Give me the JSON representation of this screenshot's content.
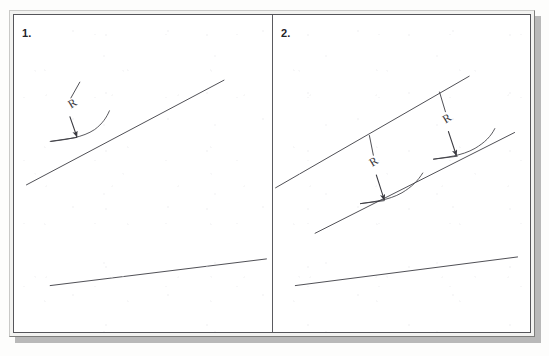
{
  "page": {
    "kind": "scanned-technical-drawing-exercise",
    "ghost_text_top": "",
    "ghost_text_bottom": "",
    "ink_color": "#3a3a40",
    "frame_color": "#55555a",
    "paper_color": "#ffffff",
    "shadow_color": "#b9b9b9"
  },
  "panels": [
    {
      "number": "1.",
      "name": "panel-one",
      "drawing": {
        "lines": [
          {
            "name": "upper-inclined-line",
            "x1": 11,
            "y1": 172,
            "x2": 211,
            "y2": 66
          },
          {
            "name": "lower-inclined-line",
            "x1": 35,
            "y1": 274,
            "x2": 254,
            "y2": 247
          }
        ],
        "radius_marks": [
          {
            "name": "radius-callout-1",
            "label": "R",
            "label_x": 56,
            "label_y": 95,
            "leader_x1": 65,
            "leader_y1": 68,
            "leader_x2": 56,
            "leader_y2": 84,
            "arrow_x1": 55,
            "arrow_y1": 103,
            "arrow_x2": 62,
            "arrow_y2": 123,
            "arc_d": "M 36 128 C 52 126, 68 124, 80 116 C 88 110, 92 104, 95 97",
            "base_d": "M 35 128 L 62 124"
          }
        ]
      }
    },
    {
      "number": "2.",
      "name": "panel-two",
      "drawing": {
        "lines": [
          {
            "name": "upper-inclined-line",
            "x1": 2,
            "y1": 175,
            "x2": 198,
            "y2": 62
          },
          {
            "name": "middle-inclined-line",
            "x1": 42,
            "y1": 221,
            "x2": 244,
            "y2": 119
          },
          {
            "name": "lower-inclined-line",
            "x1": 22,
            "y1": 274,
            "x2": 247,
            "y2": 245
          }
        ],
        "radius_marks": [
          {
            "name": "radius-callout-1",
            "label": "R",
            "label_x": 100,
            "label_y": 154,
            "leader_x1": 97,
            "leader_y1": 122,
            "leader_x2": 101,
            "leader_y2": 142,
            "arrow_x1": 104,
            "arrow_y1": 162,
            "arrow_x2": 112,
            "arrow_y2": 187,
            "arc_d": "M 88 191 C 100 189, 116 188, 130 180 C 140 174, 146 168, 151 160",
            "base_d": "M 88 191 L 112 188"
          },
          {
            "name": "radius-callout-2",
            "label": "R",
            "label_x": 174,
            "label_y": 110,
            "leader_x1": 168,
            "leader_y1": 78,
            "leader_x2": 174,
            "leader_y2": 98,
            "arrow_x1": 177,
            "arrow_y1": 118,
            "arrow_x2": 185,
            "arrow_y2": 142,
            "arc_d": "M 162 146 C 174 144, 190 143, 204 135 C 214 129, 220 123, 224 115",
            "base_d": "M 162 146 L 186 143"
          }
        ]
      }
    }
  ]
}
